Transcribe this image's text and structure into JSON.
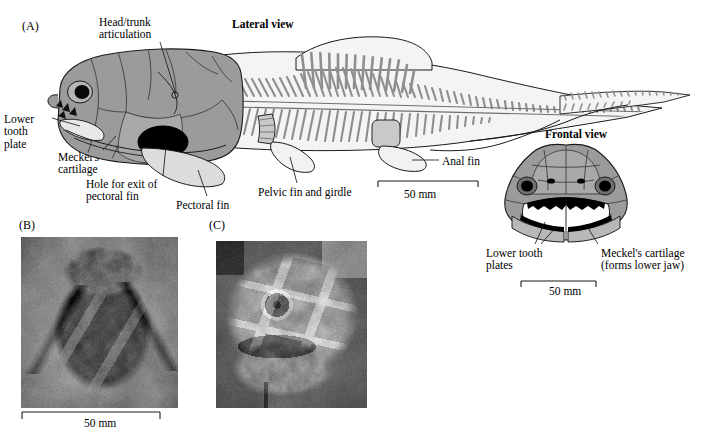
{
  "figure": {
    "panels": [
      {
        "id": "A",
        "label": "(A)"
      },
      {
        "id": "B",
        "label": "(B)"
      },
      {
        "id": "C",
        "label": "(C)"
      }
    ]
  },
  "panel_a": {
    "lateral_title": "Lateral view",
    "frontal_title": "Frontal view",
    "labels": {
      "head_trunk": "Head/trunk\narticulation",
      "lower_tooth_plate": "Lower\ntooth\nplate",
      "meckels_cartilage": "Meckel's\ncartilage",
      "hole_pectoral": "Hole for exit of\npectoral fin",
      "pectoral_fin": "Pectoral fin",
      "pelvic_fin": "Pelvic fin and girdle",
      "anal_fin": "Anal fin",
      "frontal_lower_tooth_plates": "Lower tooth\nplates",
      "frontal_meckels": "Meckel's cartilage\n(forms lower jaw)"
    },
    "scale_lateral": "50 mm",
    "scale_frontal": "50 mm"
  },
  "panel_b": {
    "scale": "50 mm",
    "caption": ""
  },
  "panel_c": {
    "caption": ""
  },
  "colors": {
    "ink": "#000000",
    "head_shade": "#9a9a9a",
    "head_shade_dark": "#8a8a8a",
    "body_light": "#efefef",
    "fin_shade": "#d8d8d8",
    "spine_grey": "#9d9d9d",
    "black_fill": "#000000",
    "photo_matrix": "#8e8e8e"
  }
}
